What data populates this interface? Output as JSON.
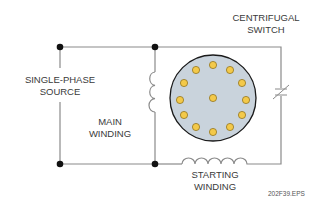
{
  "labels": {
    "source": {
      "line1": "SINGLE-PHASE",
      "line2": "SOURCE"
    },
    "main_winding": {
      "line1": "MAIN",
      "line2": "WINDING"
    },
    "starting_winding": {
      "line1": "STARTING",
      "line2": "WINDING"
    },
    "centrifugal_switch": {
      "line1": "CENTRIFUGAL",
      "line2": "SWITCH"
    }
  },
  "figure_id": "202F39.EPS",
  "colors": {
    "wire": "#8a8a8a",
    "node": "#111111",
    "rotor_fill": "#c9d3dc",
    "rotor_outline": "#1a1a1a",
    "conductor_fill": "#f3c94a",
    "conductor_outline": "#8a6a10"
  },
  "components": [
    "single-phase source",
    "main winding",
    "rotor",
    "starting winding",
    "centrifugal switch"
  ],
  "rotor": {
    "conductor_count": 13
  }
}
